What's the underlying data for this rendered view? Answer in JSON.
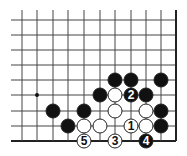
{
  "diagram": {
    "type": "go-board-diagram",
    "grid": {
      "columns_x": [
        22,
        37,
        53,
        68,
        84,
        100,
        115,
        131,
        146,
        161,
        176
      ],
      "rows_y": [
        20,
        35,
        50,
        65,
        80,
        95,
        111,
        126,
        141
      ],
      "line_start_x": 11,
      "line_start_y": 10,
      "right_edge_col": 10,
      "bottom_edge_row": 8,
      "line_color": "#444444",
      "edge_color": "#222222"
    },
    "star_points": [
      {
        "col": 1,
        "row": 5
      }
    ],
    "stone_radius": 7,
    "colors": {
      "black": "#111111",
      "white": "#ffffff",
      "outline": "#222222"
    },
    "stones": [
      {
        "col": 6,
        "row": 4,
        "color": "black",
        "label": ""
      },
      {
        "col": 7,
        "row": 4,
        "color": "black",
        "label": ""
      },
      {
        "col": 9,
        "row": 4,
        "color": "black",
        "label": ""
      },
      {
        "col": 5,
        "row": 5,
        "color": "black",
        "label": ""
      },
      {
        "col": 6,
        "row": 5,
        "color": "white",
        "label": ""
      },
      {
        "col": 7,
        "row": 5,
        "color": "black",
        "label": "2"
      },
      {
        "col": 8,
        "row": 5,
        "color": "black",
        "label": ""
      },
      {
        "col": 2,
        "row": 6,
        "color": "black",
        "label": ""
      },
      {
        "col": 4,
        "row": 6,
        "color": "black",
        "label": ""
      },
      {
        "col": 6,
        "row": 6,
        "color": "white",
        "label": ""
      },
      {
        "col": 8,
        "row": 6,
        "color": "white",
        "label": ""
      },
      {
        "col": 9,
        "row": 6,
        "color": "black",
        "label": ""
      },
      {
        "col": 3,
        "row": 7,
        "color": "black",
        "label": ""
      },
      {
        "col": 4,
        "row": 7,
        "color": "white",
        "label": ""
      },
      {
        "col": 5,
        "row": 7,
        "color": "white",
        "label": ""
      },
      {
        "col": 7,
        "row": 7,
        "color": "white",
        "label": "1"
      },
      {
        "col": 8,
        "row": 7,
        "color": "white",
        "label": ""
      },
      {
        "col": 9,
        "row": 7,
        "color": "black",
        "label": ""
      },
      {
        "col": 4,
        "row": 8,
        "color": "white",
        "label": "5"
      },
      {
        "col": 6,
        "row": 8,
        "color": "white",
        "label": "3"
      },
      {
        "col": 8,
        "row": 8,
        "color": "black",
        "label": "4"
      }
    ]
  }
}
